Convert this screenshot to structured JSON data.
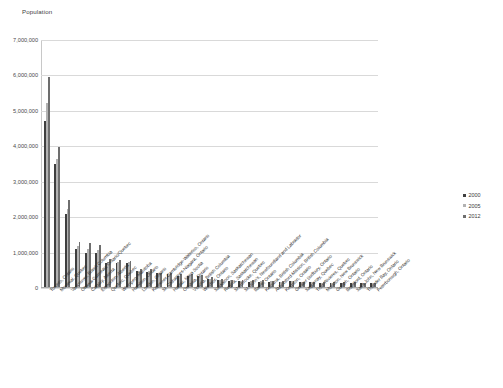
{
  "chart_data": {
    "type": "bar",
    "title": "",
    "ylabel": "Population",
    "xlabel": "",
    "ylim": [
      0,
      7000000
    ],
    "ytick_labels": [
      "7,000,000",
      "6,000,000",
      "5,000,000",
      "4,000,000",
      "3,000,000",
      "2,000,000",
      "1,000,000",
      "0"
    ],
    "ytick_values": [
      7000000,
      6000000,
      5000000,
      4000000,
      3000000,
      2000000,
      1000000,
      0
    ],
    "grid": true,
    "legend_position": "right",
    "categories": [
      "Toronto, Ontario",
      "Montreal, Quebec",
      "Vancouver, British Columbia",
      "Ottawa-Gatineau, Ontario/Quebec",
      "Calgary, Alberta",
      "Edmonton, Alberta",
      "Quebec, Quebec",
      "Winnipeg, Manitoba",
      "Hamilton, Ontario",
      "London, Ontario",
      "Kitchener-Cambridge-Waterloo, Ontario",
      "St. Catharines-Niagara, Ontario",
      "Halifax, Nova Scotia",
      "Oshawa, Ontario",
      "Victoria, British Columbia",
      "Windsor, Ontario",
      "Saskatoon, Saskatchewan",
      "Regina, Saskatchewan",
      "Sherbrooke, Quebec",
      "St. John's, Newfoundland and Labrador",
      "Barrie, Ontario",
      "Kelowna, British Columbia",
      "Abbotsford-Mission, British Columbia",
      "Kingston, Ontario",
      "Greater Sudbury, Ontario",
      "Saguenay, Quebec",
      "Trois-Rivieres, Quebec",
      "Moncton, New Brunswick",
      "Guelph, Ontario",
      "Brantford, Ontario",
      "Saint John, New Brunswick",
      "Thunder Bay, Ontario",
      "Peterborough, Ontario"
    ],
    "series": [
      {
        "name": "2000",
        "color": "#3f3f3f",
        "values": [
          4700000,
          3480000,
          2070000,
          1080000,
          960000,
          950000,
          690000,
          680000,
          670000,
          440000,
          430000,
          385000,
          365000,
          300000,
          320000,
          310000,
          230000,
          195000,
          180000,
          175000,
          155000,
          155000,
          155000,
          150000,
          160000,
          155000,
          140000,
          120000,
          120000,
          120000,
          125000,
          125000,
          110000
        ]
      },
      {
        "name": "2005",
        "color": "#b2b2b2",
        "values": [
          5200000,
          3600000,
          2200000,
          1150000,
          1080000,
          1040000,
          720000,
          700000,
          700000,
          460000,
          460000,
          395000,
          375000,
          325000,
          335000,
          325000,
          240000,
          200000,
          190000,
          180000,
          175000,
          165000,
          165000,
          155000,
          160000,
          155000,
          145000,
          125000,
          125000,
          125000,
          125000,
          125000,
          115000
        ]
      },
      {
        "name": "2012",
        "color": "#6e6e6e",
        "values": [
          5920000,
          3950000,
          2450000,
          1260000,
          1250000,
          1190000,
          780000,
          760000,
          740000,
          500000,
          500000,
          400000,
          405000,
          375000,
          355000,
          330000,
          275000,
          225000,
          205000,
          205000,
          195000,
          185000,
          180000,
          165000,
          165000,
          155000,
          155000,
          145000,
          145000,
          140000,
          130000,
          125000,
          120000
        ]
      }
    ]
  },
  "legend": {
    "items": [
      {
        "label": "2000"
      },
      {
        "label": "2005"
      },
      {
        "label": "2012"
      }
    ]
  },
  "colors": {
    "series_2000": "#3f3f3f",
    "series_2005": "#b2b2b2",
    "series_2012": "#6e6e6e",
    "gridline": "#d9d9d9",
    "axis": "#a8a8a8",
    "background": "#ffffff",
    "text": "#3a3a3a"
  }
}
